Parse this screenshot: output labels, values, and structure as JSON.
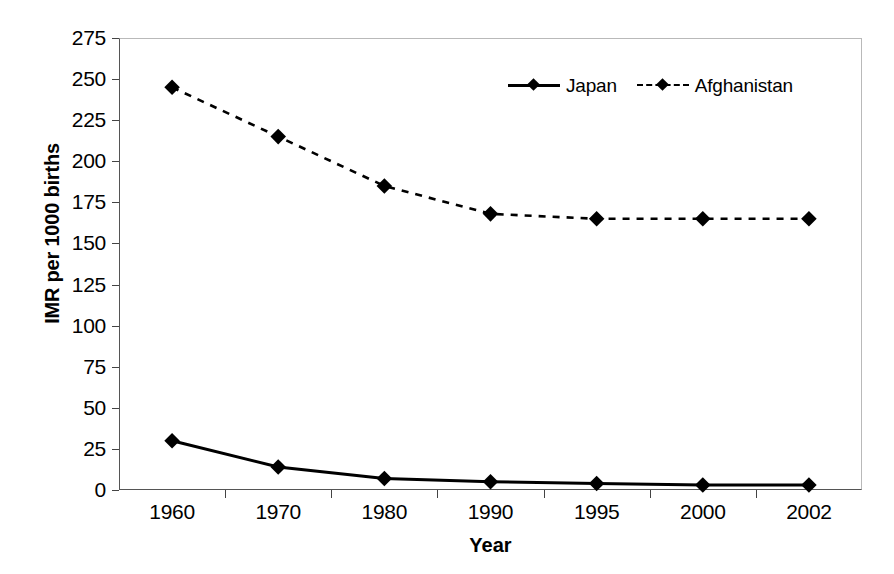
{
  "chart_data": {
    "type": "line",
    "title": "",
    "xlabel": "Year",
    "ylabel": "IMR per 1000 births",
    "categories": [
      "1960",
      "1970",
      "1980",
      "1990",
      "1995",
      "2000",
      "2002"
    ],
    "series": [
      {
        "name": "Japan",
        "values": [
          30,
          14,
          7,
          5,
          4,
          3,
          3
        ],
        "line_style": "solid",
        "marker": "diamond",
        "color": "#000000"
      },
      {
        "name": "Afghanistan",
        "values": [
          245,
          215,
          185,
          168,
          165,
          165,
          165
        ],
        "line_style": "dashed",
        "marker": "diamond",
        "color": "#000000"
      }
    ],
    "ylim": [
      0,
      275
    ],
    "yticks": [
      0,
      25,
      50,
      75,
      100,
      125,
      150,
      175,
      200,
      225,
      250,
      275
    ],
    "ytick_labels": [
      "0",
      "25",
      "50",
      "75",
      "100",
      "125",
      "150",
      "175",
      "200",
      "225",
      "250",
      "275"
    ],
    "grid": false,
    "legend_position": "top-center"
  },
  "legend": {
    "entries": [
      {
        "label": "Japan"
      },
      {
        "label": "Afghanistan"
      }
    ]
  }
}
